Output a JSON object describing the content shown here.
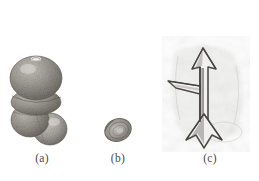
{
  "figure": {
    "kind": "scientific-specimen-plate",
    "background_color": "#ffffff",
    "ink_color": "#575552",
    "caption_color": "#4a4a48",
    "panel_count": 3
  },
  "panels": [
    {
      "id": "a",
      "caption": "(a)",
      "subject": "multi-chambered-globular-shell",
      "description": "trochospiral foraminiferal test with three inflated spherical chambers, stippled granular surface",
      "chambers": 3,
      "bbox": {
        "x": 14,
        "y": 60,
        "w": 54,
        "h": 88
      }
    },
    {
      "id": "b",
      "caption": "(b)",
      "subject": "small-oval-shell",
      "description": "small elliptical test in oblique view with concentric growth rings and granular texture",
      "bbox": {
        "x": 104,
        "y": 116,
        "w": 27,
        "h": 28
      }
    },
    {
      "id": "c",
      "caption": "(c)",
      "subject": "anchor-spicule",
      "description": "line-drawn anchor-shaped spicule with arrow head, lateral arm and flared bifid base, over faint mottled matrix",
      "bbox": {
        "x": 172,
        "y": 44,
        "w": 70,
        "h": 104
      }
    }
  ],
  "captions": {
    "a": "(a)",
    "b": "(b)",
    "c": "(c)"
  }
}
